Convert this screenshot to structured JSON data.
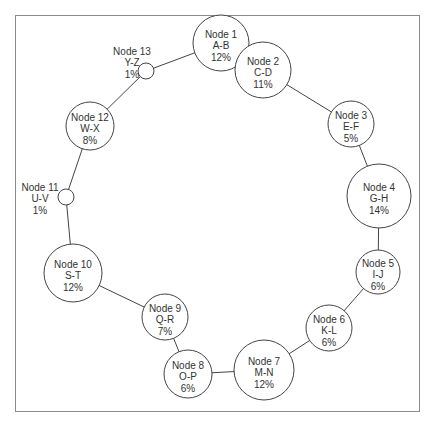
{
  "diagram": {
    "type": "ring-network",
    "nodes": [
      {
        "id": 1,
        "name": "Node 1",
        "range": "A-B",
        "share": "12%",
        "cx": 221,
        "cy": 43,
        "r": 28,
        "label_outside": false
      },
      {
        "id": 2,
        "name": "Node 2",
        "range": "C-D",
        "share": "11%",
        "cx": 263,
        "cy": 70,
        "r": 28,
        "label_outside": false
      },
      {
        "id": 3,
        "name": "Node 3",
        "range": "E-F",
        "share": "5%",
        "cx": 351,
        "cy": 124,
        "r": 23,
        "label_outside": false
      },
      {
        "id": 4,
        "name": "Node 4",
        "range": "G-H",
        "share": "14%",
        "cx": 379,
        "cy": 196,
        "r": 32,
        "label_outside": false
      },
      {
        "id": 5,
        "name": "Node 5",
        "range": "I-J",
        "share": "6%",
        "cx": 378,
        "cy": 272,
        "r": 22,
        "label_outside": false
      },
      {
        "id": 6,
        "name": "Node 6",
        "range": "K-L",
        "share": "6%",
        "cx": 329,
        "cy": 328,
        "r": 23,
        "label_outside": false
      },
      {
        "id": 7,
        "name": "Node 7",
        "range": "M-N",
        "share": "12%",
        "cx": 264,
        "cy": 370,
        "r": 30,
        "label_outside": false
      },
      {
        "id": 8,
        "name": "Node 8",
        "range": "O-P",
        "share": "6%",
        "cx": 188,
        "cy": 374,
        "r": 24,
        "label_outside": false
      },
      {
        "id": 9,
        "name": "Node 9",
        "range": "Q-R",
        "share": "7%",
        "cx": 165,
        "cy": 317,
        "r": 23,
        "label_outside": false
      },
      {
        "id": 10,
        "name": "Node 10",
        "range": "S-T",
        "share": "12%",
        "cx": 73,
        "cy": 273,
        "r": 29,
        "label_outside": false
      },
      {
        "id": 11,
        "name": "Node 11",
        "range": "U-V",
        "share": "1%",
        "cx": 66,
        "cy": 197,
        "r": 8,
        "label_outside": true,
        "lx": 40,
        "ly": 187
      },
      {
        "id": 12,
        "name": "Node 12",
        "range": "W-X",
        "share": "8%",
        "cx": 90,
        "cy": 126,
        "r": 24,
        "label_outside": false
      },
      {
        "id": 13,
        "name": "Node 13",
        "range": "Y-Z",
        "share": "1%",
        "cx": 146,
        "cy": 71,
        "r": 8,
        "label_outside": true,
        "lx": 132,
        "ly": 51
      }
    ],
    "edges": [
      [
        1,
        2
      ],
      [
        2,
        3
      ],
      [
        3,
        4
      ],
      [
        4,
        5
      ],
      [
        5,
        6
      ],
      [
        6,
        7
      ],
      [
        7,
        8
      ],
      [
        8,
        9
      ],
      [
        9,
        10
      ],
      [
        10,
        11
      ],
      [
        11,
        12
      ],
      [
        12,
        13
      ],
      [
        13,
        1
      ]
    ]
  }
}
